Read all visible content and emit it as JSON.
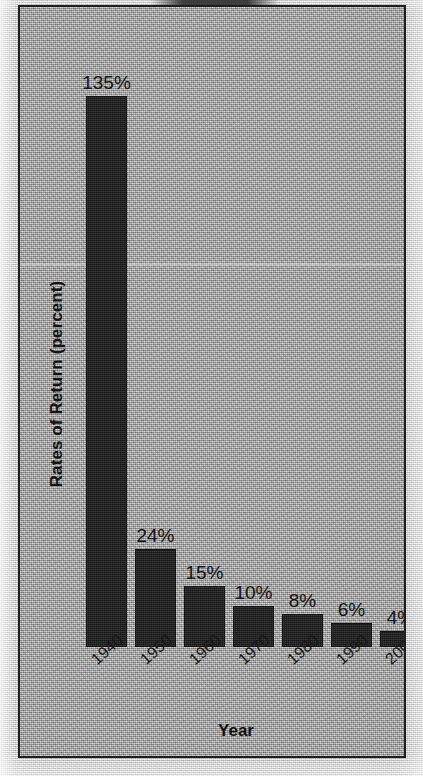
{
  "chart_data": {
    "type": "bar",
    "title": "",
    "xlabel": "Year",
    "ylabel": "Rates of Return (percent)",
    "categories": [
      "1940",
      "1950",
      "1960",
      "1970",
      "1980",
      "1990",
      "2000"
    ],
    "values": [
      135,
      24,
      15,
      10,
      8,
      6,
      4
    ],
    "value_labels": [
      "135%",
      "24%",
      "15%",
      "10%",
      "8%",
      "6%",
      "4%"
    ],
    "ylim": [
      0,
      148
    ],
    "grid": false,
    "legend": null,
    "bar_color": "#272727",
    "plot_background": "#a3a3a3",
    "text_color": "#141414",
    "frame_color": "#1d1d1d",
    "series": [
      {
        "name": "Rates of Return",
        "values": [
          135,
          24,
          15,
          10,
          8,
          6,
          4
        ]
      }
    ],
    "points": [
      {
        "category": "1940",
        "value": 135,
        "label": "135%"
      },
      {
        "category": "1950",
        "value": 24,
        "label": "24%"
      },
      {
        "category": "1960",
        "value": 15,
        "label": "15%"
      },
      {
        "category": "1970",
        "value": 10,
        "label": "10%"
      },
      {
        "category": "1980",
        "value": 8,
        "label": "8%"
      },
      {
        "category": "1990",
        "value": 6,
        "label": "6%"
      },
      {
        "category": "2000",
        "value": 4,
        "label": "4%"
      }
    ]
  }
}
